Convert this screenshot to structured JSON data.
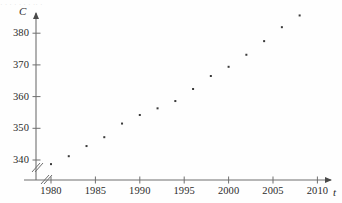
{
  "chart_data": {
    "type": "scatter",
    "title": "",
    "xlabel": "t",
    "ylabel": "C",
    "xlim": [
      1978.5,
      2011.5
    ],
    "ylim": [
      336,
      388
    ],
    "grid": false,
    "legend": "none",
    "axis_break": {
      "x": true,
      "y": true,
      "symbol": "//"
    },
    "xticks": [
      1980,
      1985,
      1990,
      1995,
      2000,
      2005,
      2010
    ],
    "xtick_labels": [
      "1980",
      "1985",
      "1990",
      "1995",
      "2000",
      "2005",
      "2010"
    ],
    "yticks": [
      340,
      350,
      360,
      370,
      380
    ],
    "ytick_labels": [
      "340",
      "350",
      "360",
      "370",
      "380"
    ],
    "x": [
      1980,
      1982,
      1984,
      1986,
      1988,
      1990,
      1992,
      1994,
      1996,
      1998,
      2000,
      2002,
      2004,
      2006,
      2008
    ],
    "values": [
      338.7,
      341.2,
      344.4,
      347.2,
      351.5,
      354.2,
      356.3,
      358.6,
      362.4,
      366.5,
      369.4,
      373.2,
      377.5,
      381.9,
      385.6
    ],
    "points": [
      {
        "t": 1980,
        "C": 338.7
      },
      {
        "t": 1982,
        "C": 341.2
      },
      {
        "t": 1984,
        "C": 344.4
      },
      {
        "t": 1986,
        "C": 347.2
      },
      {
        "t": 1988,
        "C": 351.5
      },
      {
        "t": 1990,
        "C": 354.2
      },
      {
        "t": 1992,
        "C": 356.3
      },
      {
        "t": 1994,
        "C": 358.6
      },
      {
        "t": 1996,
        "C": 362.4
      },
      {
        "t": 1998,
        "C": 366.5
      },
      {
        "t": 2000,
        "C": 369.4
      },
      {
        "t": 2002,
        "C": 373.2
      },
      {
        "t": 2004,
        "C": 377.5
      },
      {
        "t": 2006,
        "C": 381.9
      },
      {
        "t": 2008,
        "C": 385.6
      }
    ],
    "marker": {
      "shape": "square",
      "size": 2,
      "color": "#3a3a3a"
    }
  },
  "axes": {
    "y_axis_name": "C",
    "x_axis_name": "t"
  },
  "colors": {
    "axis": "#6f6f6f",
    "marker": "#3a3a3a",
    "text": "#2b2b2b",
    "background": "#ffffff"
  },
  "artifact": {
    "top_strip_text": "· ·   ·  ·      ·   ·    · ·· ·"
  }
}
